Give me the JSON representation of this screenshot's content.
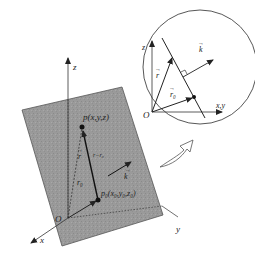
{
  "main_figure": {
    "axes": {
      "z_label": "z",
      "x_label": "x",
      "y_label": "y",
      "origin_label": "O"
    },
    "plane_color": "#9a9a9a",
    "point_p_label": "p(x,y,z)",
    "point_p0_label": "p₀(x₀,y₀,z₀)",
    "vector_r_label": "r",
    "vector_r0_label": "r₀",
    "vector_r_minus_r0_label": "r−r₀",
    "vector_k_label": "k"
  },
  "inset_figure": {
    "z_label": "z",
    "xy_label": "x,y",
    "origin_label": "O",
    "vector_r_label": "r",
    "vector_r0_label": "r₀",
    "vector_k_label": "k"
  },
  "arrow_connector": "zoom-arrow"
}
